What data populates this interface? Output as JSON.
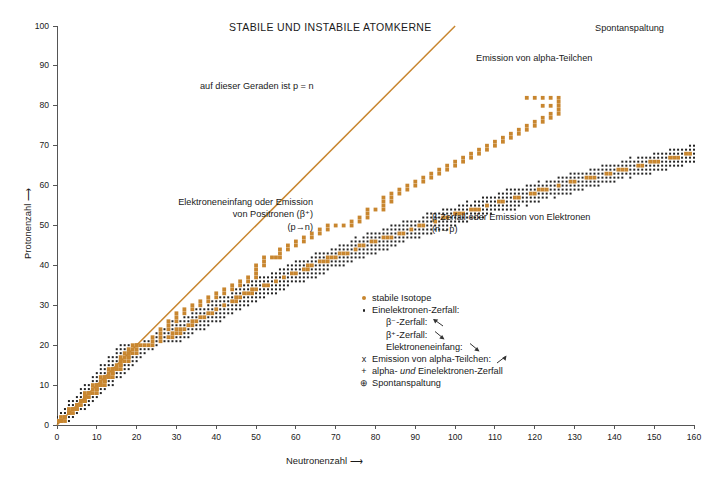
{
  "title": "STABILE UND INSTABILE ATOMKERNE",
  "axes": {
    "x": {
      "label": "Neutronenzahl ⟶",
      "min": 0,
      "max": 160,
      "step": 10,
      "ticks": [
        "0",
        "10",
        "20",
        "30",
        "40",
        "50",
        "60",
        "70",
        "80",
        "90",
        "100",
        "110",
        "120",
        "130",
        "140",
        "150",
        "160"
      ]
    },
    "y": {
      "label": "Protonenzahl ⟶",
      "min": 0,
      "max": 100,
      "step": 10,
      "ticks": [
        "0",
        "10",
        "20",
        "30",
        "40",
        "50",
        "60",
        "70",
        "80",
        "90",
        "100"
      ]
    }
  },
  "annotations": {
    "pn_line": "auf dieser Geraden ist p = n",
    "left_line1": "Elektroneneinfang oder Emission",
    "left_line2": "von Positronen (β⁺)",
    "left_line3": "(p→n)",
    "right_line1": "β-Zerfall oder Emission von Elektronen",
    "right_line2": "(n→p)",
    "alpha": "Emission von alpha-Teilchen",
    "spontan": "Spontanspaltung"
  },
  "legend": {
    "stable": "stabile Isotope",
    "single_electron": "Einelektronen-Zerfall:",
    "beta_minus": "β⁻-Zerfall:",
    "beta_plus": "β⁺-Zerfall:",
    "electron_capture": "Elektroneneinfang:",
    "alpha_emission": "Emission von alpha-Teilchen:",
    "alpha_and_electron_pre": "alpha- ",
    "alpha_and_electron_ital": "und",
    "alpha_and_electron_post": " Einelektronen-Zerfall",
    "spontaneous_fission": "Spontanspaltung",
    "symbols": {
      "stable": "orange-dot",
      "single_electron": "black-dot",
      "alpha_emission": "x",
      "alpha_and_electron": "+",
      "spontaneous_fission": "⊕"
    }
  },
  "colors": {
    "stable_orange": "#C8862F",
    "unstable_black": "#232323",
    "pn_line": "#C8862F",
    "axis": "#555555",
    "background": "#FFFFFF"
  },
  "chart_data": {
    "type": "scatter",
    "title": "STABILE UND INSTABILE ATOMKERNE",
    "xlabel": "Neutronenzahl ⟶",
    "ylabel": "Protonenzahl ⟶",
    "xlim": [
      0,
      160
    ],
    "ylim": [
      0,
      100
    ],
    "xtick_step": 10,
    "ytick_step": 10,
    "grid": false,
    "legend_position": "center-right-inside",
    "reference_line": {
      "name": "p = n",
      "from": [
        0,
        0
      ],
      "to": [
        100,
        100
      ],
      "color": "#C8862F"
    },
    "series": [
      {
        "name": "stabile Isotope",
        "marker": "orange-square-dot",
        "color": "#C8862F",
        "description": "Tal der Stabilität: N≈Z bis Z≈20, danach N/Z steigt auf ca. 1.5 bei Z≈83",
        "valley_points": [
          [
            0,
            1
          ],
          [
            1,
            1
          ],
          [
            2,
            2
          ],
          [
            3,
            3
          ],
          [
            4,
            3
          ],
          [
            4,
            4
          ],
          [
            5,
            4
          ],
          [
            5,
            5
          ],
          [
            6,
            5
          ],
          [
            6,
            6
          ],
          [
            7,
            6
          ],
          [
            7,
            7
          ],
          [
            8,
            8
          ],
          [
            9,
            8
          ],
          [
            10,
            8
          ],
          [
            10,
            9
          ],
          [
            10,
            10
          ],
          [
            11,
            10
          ],
          [
            12,
            10
          ],
          [
            12,
            11
          ],
          [
            12,
            12
          ],
          [
            13,
            12
          ],
          [
            14,
            12
          ],
          [
            14,
            13
          ],
          [
            14,
            14
          ],
          [
            15,
            14
          ],
          [
            16,
            14
          ],
          [
            16,
            15
          ],
          [
            16,
            16
          ],
          [
            17,
            16
          ],
          [
            18,
            16
          ],
          [
            18,
            17
          ],
          [
            18,
            18
          ],
          [
            19,
            18
          ],
          [
            20,
            18
          ],
          [
            20,
            19
          ],
          [
            20,
            20
          ],
          [
            22,
            20
          ],
          [
            23,
            20
          ],
          [
            24,
            20
          ],
          [
            24,
            21
          ],
          [
            24,
            22
          ],
          [
            26,
            22
          ],
          [
            26,
            23
          ],
          [
            26,
            24
          ],
          [
            28,
            24
          ],
          [
            28,
            25
          ],
          [
            28,
            26
          ],
          [
            30,
            26
          ],
          [
            30,
            27
          ],
          [
            30,
            28
          ],
          [
            32,
            28
          ],
          [
            32,
            29
          ],
          [
            34,
            29
          ],
          [
            34,
            30
          ],
          [
            36,
            30
          ],
          [
            36,
            31
          ],
          [
            38,
            31
          ],
          [
            38,
            32
          ],
          [
            40,
            32
          ],
          [
            40,
            33
          ],
          [
            42,
            33
          ],
          [
            42,
            34
          ],
          [
            44,
            34
          ],
          [
            44,
            35
          ],
          [
            46,
            35
          ],
          [
            46,
            36
          ],
          [
            48,
            36
          ],
          [
            48,
            37
          ],
          [
            50,
            37
          ],
          [
            50,
            38
          ],
          [
            50,
            39
          ],
          [
            50,
            40
          ],
          [
            52,
            40
          ],
          [
            52,
            41
          ],
          [
            52,
            42
          ],
          [
            54,
            42
          ],
          [
            55,
            42
          ],
          [
            56,
            42
          ],
          [
            56,
            43
          ],
          [
            56,
            44
          ],
          [
            58,
            44
          ],
          [
            58,
            45
          ],
          [
            60,
            45
          ],
          [
            60,
            46
          ],
          [
            62,
            46
          ],
          [
            62,
            47
          ],
          [
            64,
            47
          ],
          [
            64,
            48
          ],
          [
            66,
            48
          ],
          [
            66,
            49
          ],
          [
            68,
            49
          ],
          [
            68,
            50
          ],
          [
            70,
            50
          ],
          [
            72,
            50
          ],
          [
            74,
            50
          ],
          [
            74,
            51
          ],
          [
            76,
            51
          ],
          [
            76,
            52
          ],
          [
            78,
            52
          ],
          [
            78,
            53
          ],
          [
            78,
            54
          ],
          [
            80,
            54
          ],
          [
            82,
            54
          ],
          [
            82,
            55
          ],
          [
            82,
            56
          ],
          [
            84,
            56
          ],
          [
            82,
            57
          ],
          [
            84,
            57
          ],
          [
            84,
            58
          ],
          [
            86,
            58
          ],
          [
            86,
            59
          ],
          [
            88,
            59
          ],
          [
            88,
            60
          ],
          [
            90,
            60
          ],
          [
            90,
            61
          ],
          [
            92,
            61
          ],
          [
            92,
            62
          ],
          [
            94,
            62
          ],
          [
            94,
            63
          ],
          [
            96,
            63
          ],
          [
            96,
            64
          ],
          [
            98,
            64
          ],
          [
            98,
            65
          ],
          [
            100,
            65
          ],
          [
            100,
            66
          ],
          [
            102,
            66
          ],
          [
            102,
            67
          ],
          [
            104,
            67
          ],
          [
            104,
            68
          ],
          [
            106,
            68
          ],
          [
            106,
            69
          ],
          [
            108,
            69
          ],
          [
            108,
            70
          ],
          [
            110,
            70
          ],
          [
            110,
            71
          ],
          [
            112,
            71
          ],
          [
            112,
            72
          ],
          [
            114,
            72
          ],
          [
            114,
            73
          ],
          [
            116,
            73
          ],
          [
            116,
            74
          ],
          [
            118,
            74
          ],
          [
            118,
            75
          ],
          [
            120,
            75
          ],
          [
            120,
            76
          ],
          [
            122,
            76
          ],
          [
            122,
            77
          ],
          [
            124,
            77
          ],
          [
            124,
            78
          ],
          [
            126,
            78
          ],
          [
            126,
            79
          ],
          [
            126,
            80
          ],
          [
            122,
            80
          ],
          [
            124,
            80
          ],
          [
            126,
            81
          ],
          [
            126,
            82
          ],
          [
            124,
            82
          ],
          [
            122,
            82
          ],
          [
            120,
            82
          ],
          [
            118,
            82
          ]
        ],
        "approx_count": 270
      },
      {
        "name": "Einelektronen-Zerfall",
        "marker": "small-black-dot",
        "color": "#232323",
        "description": "dichte Punktwolke beidseits des Stabilitätstals; Breite ca. ±4-8 Nukleonen, nimmt mit Z zu",
        "approx_count": 2000
      },
      {
        "name": "Emission von alpha-Teilchen",
        "marker": "x",
        "color": "#232323",
        "description": "Bereich oberhalb Z≈83 (Bi) bis Z≈100, N≈126-160",
        "approx_count": 180
      },
      {
        "name": "alpha- und Einelektronen-Zerfall",
        "marker": "+",
        "color": "#232323",
        "description": "Mischbereich Z≈80-95, N≈120-150",
        "approx_count": 160
      },
      {
        "name": "Spontanspaltung",
        "marker": "circled-plus",
        "color": "#232323",
        "description": "schwerste Kerne, Z≈90-102, N≈140-160",
        "approx_count": 60
      }
    ]
  }
}
